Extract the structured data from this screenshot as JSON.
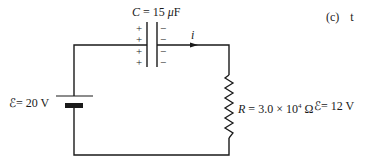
{
  "circuit": {
    "capacitor": {
      "symbol": "C",
      "equals": "=",
      "value": "15",
      "unit_prefix": "μ",
      "unit": "F",
      "plus_signs": [
        "+",
        "+",
        "+",
        "+"
      ],
      "minus_signs": [
        "−",
        "−",
        "−",
        "−"
      ]
    },
    "current": {
      "symbol": "i"
    },
    "battery": {
      "symbol": "ℰ",
      "equals": "=",
      "value": "20",
      "unit": "V"
    },
    "resistor": {
      "symbol": "R",
      "equals": "=",
      "mantissa": "3.0",
      "times": "×",
      "base": "10",
      "exponent": "4",
      "unit": "Ω"
    },
    "resistor_emf": {
      "symbol": "ℰ",
      "equals": "=",
      "value": "12",
      "unit": "V"
    }
  },
  "side_text": {
    "label": "(c)",
    "text": "t"
  },
  "colors": {
    "wire": "#1a1a1a",
    "background": "#ffffff"
  }
}
